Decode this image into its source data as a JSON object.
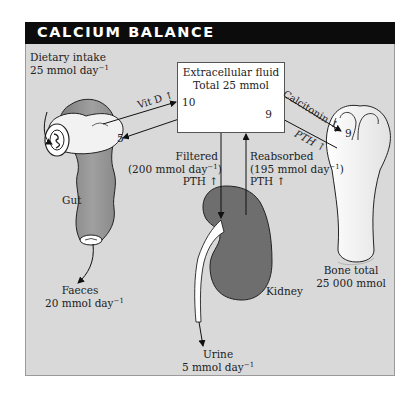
{
  "title": "CALCIUM BALANCE",
  "ecf": {
    "line1": "Extracellular fluid",
    "line2": "Total 25 mmol",
    "in_from_gut": "10",
    "out_to_bone": "9"
  },
  "intake": {
    "line1": "Dietary intake",
    "line2": "25 mmol day",
    "exp": "−1"
  },
  "gut": {
    "label": "Gut",
    "secretion": "5",
    "absorption_regulator": "Vit D",
    "absorption_arrow": "↑"
  },
  "faeces": {
    "line1": "Faeces",
    "line2": "20 mmol day",
    "exp": "−1"
  },
  "filtered": {
    "line1": "Filtered",
    "line2_pre": "(200 mmol day",
    "exp": "−1",
    "line2_post": ")",
    "line3": "PTH ↑"
  },
  "reabsorbed": {
    "line1": "Reabsorbed",
    "line2_pre": "(195 mmol day",
    "exp": "−1",
    "line2_post": ")",
    "line3": "PTH ↑"
  },
  "bone": {
    "deposit_regulator": "Calcitonin ↑",
    "resorb_regulator": "PTH ↑",
    "in_value": "9",
    "line1": "Bone total",
    "line2": "25 000 mmol"
  },
  "kidney": {
    "label": "Kidney"
  },
  "urine": {
    "line1": "Urine",
    "line2": "5 mmol day",
    "exp": "−1"
  },
  "colors": {
    "panel_bg": "#d9d9d9",
    "header_bg": "#0c0c0c",
    "kidney_fill": "#6e6e6e",
    "gut_fill": "#8a8a8a",
    "bone_fill": "#efefef"
  }
}
